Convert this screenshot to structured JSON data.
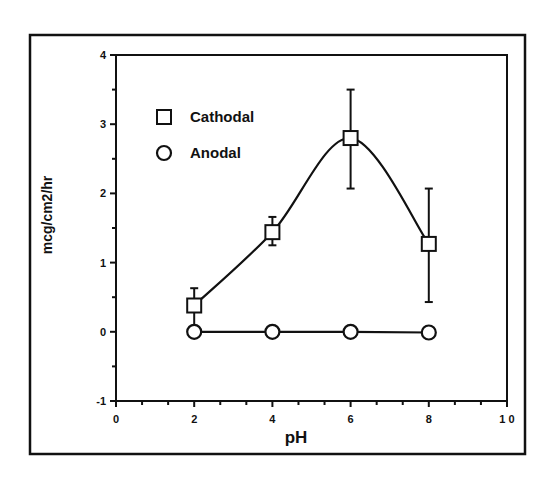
{
  "chart_data": {
    "type": "line",
    "title": "",
    "xlabel": "pH",
    "ylabel": "mcg/cm2/hr",
    "xlim": [
      0,
      10
    ],
    "ylim": [
      -1,
      4
    ],
    "x_ticks": [
      0,
      2,
      4,
      6,
      8,
      10
    ],
    "x_tick_labels": [
      "0",
      "2",
      "4",
      "6",
      "8",
      "1 0"
    ],
    "y_ticks": [
      -1,
      0,
      1,
      2,
      3,
      4
    ],
    "y_tick_labels": [
      "-1",
      "0",
      "1",
      "2",
      "3",
      "4"
    ],
    "grid": false,
    "legend_position": "upper-left",
    "x": [
      2,
      4,
      6,
      8
    ],
    "series": [
      {
        "name": "Cathodal",
        "marker": "square",
        "values": [
          0.38,
          1.44,
          2.8,
          1.27
        ],
        "error_upper": [
          0.63,
          1.66,
          3.5,
          2.07
        ],
        "error_lower": [
          0.0,
          1.25,
          2.07,
          0.43
        ],
        "line": "smooth"
      },
      {
        "name": "Anodal",
        "marker": "circle",
        "values": [
          0.0,
          0.0,
          0.0,
          -0.01
        ],
        "line": "straight"
      }
    ]
  },
  "colors": {
    "ink": "#111111",
    "background": "#ffffff"
  }
}
